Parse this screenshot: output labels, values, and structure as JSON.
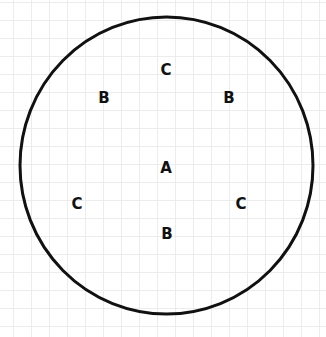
{
  "diagram": {
    "circle": {
      "cx": 166.5,
      "cy": 165.5,
      "rx": 146.5,
      "ry": 148.5,
      "stroke": "#111111",
      "stroke_width": 3
    },
    "labels": [
      {
        "id": "c-top",
        "text": "C",
        "x": 166,
        "y": 70
      },
      {
        "id": "b-left",
        "text": "B",
        "x": 104,
        "y": 98
      },
      {
        "id": "b-right",
        "text": "B",
        "x": 229,
        "y": 98
      },
      {
        "id": "a-center",
        "text": "A",
        "x": 166,
        "y": 168
      },
      {
        "id": "c-left",
        "text": "C",
        "x": 77,
        "y": 204
      },
      {
        "id": "c-right",
        "text": "C",
        "x": 241,
        "y": 204
      },
      {
        "id": "b-bottom",
        "text": "B",
        "x": 167,
        "y": 234
      }
    ]
  }
}
